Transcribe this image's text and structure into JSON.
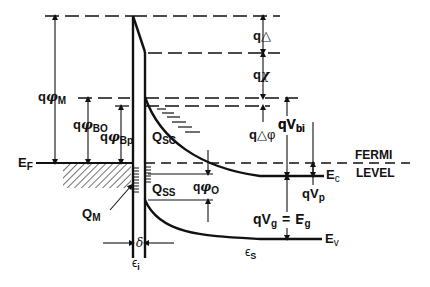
{
  "diagram": {
    "type": "energy-band-diagram",
    "colors": {
      "line": "#111111",
      "background": "#ffffff"
    },
    "labels": {
      "q_phi_M": {
        "q": "q",
        "sym": "φ",
        "sub": "M"
      },
      "q_phi_BO": {
        "q": "q",
        "sym": "φ",
        "sub": "BO"
      },
      "q_phi_Bp": {
        "q": "q",
        "sym": "φ",
        "sub": "Bp"
      },
      "E_F": {
        "main": "E",
        "sub": "F"
      },
      "Q_M": {
        "main": "Q",
        "sub": "M"
      },
      "Q_SC": {
        "main": "Q",
        "sub": "SC"
      },
      "Q_SS": {
        "main": "Q",
        "sub": "SS"
      },
      "q_phi_O": {
        "q": "q",
        "sym": "φ",
        "sub": "O"
      },
      "q_delta": {
        "q": "q",
        "sym": "△"
      },
      "q_chi": {
        "q": "q",
        "sym": "χ"
      },
      "q_delta_phi": {
        "q": "q",
        "sym": "△φ"
      },
      "q_V_bi": {
        "main": "qV",
        "sub": "bi"
      },
      "E_c": {
        "main": "E",
        "sub": "c"
      },
      "fermi_level": {
        "line1": "FERMI",
        "line2": "LEVEL"
      },
      "q_V_p": {
        "main": "qV",
        "sub": "p"
      },
      "q_V_g": {
        "main": "qV",
        "sub": "g",
        "eq": "=",
        "rhs": "E",
        "rhs_sub": "g"
      },
      "E_v": {
        "main": "E",
        "sub": "v"
      },
      "delta": {
        "sym": "δ"
      },
      "eps_i": {
        "sym": "ϵ",
        "sub": "i"
      },
      "eps_s": {
        "sym": "ϵ",
        "sub": "S"
      }
    }
  }
}
